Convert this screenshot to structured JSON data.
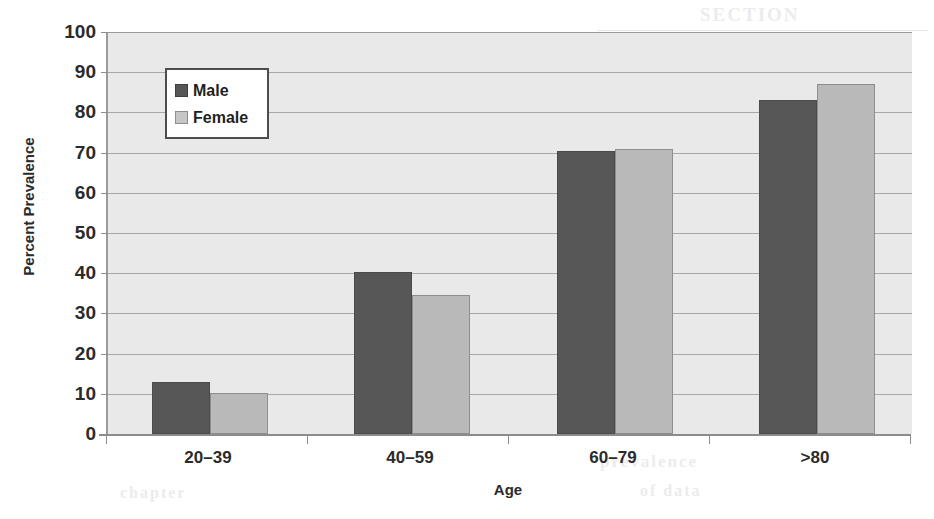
{
  "chart_data": {
    "type": "bar",
    "title": "",
    "xlabel": "Age",
    "ylabel": "Percent Prevalence",
    "categories": [
      "20–39",
      "40–59",
      "60–79",
      ">80"
    ],
    "series": [
      {
        "name": "Male",
        "values": [
          13,
          40.3,
          70.3,
          83
        ],
        "color": "#575757"
      },
      {
        "name": "Female",
        "values": [
          10.3,
          34.5,
          71,
          87
        ],
        "color": "#b9b9b9"
      }
    ],
    "ylim": [
      0,
      100
    ],
    "y_ticks": [
      100,
      90,
      80,
      70,
      60,
      50,
      40,
      30,
      20,
      10,
      0
    ],
    "grid": true,
    "legend_position": "upper-left-inside",
    "plot_background": "#e9e9e9",
    "gridline_color": "#a8a8a8"
  },
  "legend": {
    "items": [
      {
        "label": "Male",
        "swatch": "male"
      },
      {
        "label": "Female",
        "swatch": "female"
      }
    ]
  },
  "artifacts": {
    "top": "SECTION",
    "mid": "Figure",
    "bottom": "prevalence",
    "bottom2": "of data",
    "left": "chapter"
  }
}
